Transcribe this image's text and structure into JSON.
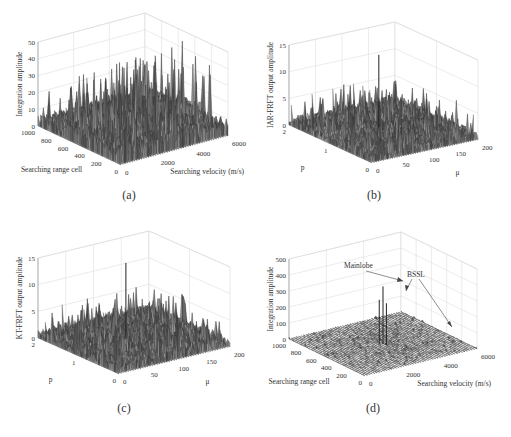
{
  "chart_data": [
    {
      "id": "a",
      "type": "surface3d",
      "caption": "(a)",
      "zlabel": "Integration amplitude",
      "xlabel": "Searching range cell",
      "ylabel": "Searching velocity (m/s)",
      "zticks": [
        "0",
        "10",
        "20",
        "30",
        "40",
        "50"
      ],
      "xticks": [
        "1000",
        "800",
        "600",
        "400",
        "200",
        "0"
      ],
      "yticks": [
        "0",
        "2000",
        "4000",
        "6000"
      ],
      "zlim": [
        0,
        50
      ],
      "xlim": [
        0,
        1000
      ],
      "ylim": [
        0,
        6000
      ],
      "noise_level": 0.35,
      "spike_level": 0.6,
      "peaks": []
    },
    {
      "id": "b",
      "type": "surface3d",
      "caption": "(b)",
      "zlabel": "IAR-FRFT output amplitude",
      "xlabel": "p",
      "ylabel": "μ",
      "zticks": [
        "0",
        "5",
        "10",
        "15"
      ],
      "xticks": [
        "2",
        "1",
        "0"
      ],
      "yticks": [
        "0",
        "50",
        "100",
        "150",
        "200"
      ],
      "zlim": [
        0,
        15
      ],
      "xlim": [
        0,
        2.5
      ],
      "ylim": [
        0,
        200
      ],
      "noise_level": 0.18,
      "spike_level": 0.3,
      "peaks": [
        {
          "u": 0.62,
          "v": 0.55,
          "h": 0.9
        }
      ]
    },
    {
      "id": "c",
      "type": "surface3d",
      "caption": "(c)",
      "zlabel": "KT-FRFT output amplitude",
      "xlabel": "p",
      "ylabel": "μ",
      "zticks": [
        "0",
        "5",
        "10",
        "15"
      ],
      "xticks": [
        "2",
        "1",
        "0"
      ],
      "yticks": [
        "0",
        "50",
        "100",
        "150",
        "200"
      ],
      "zlim": [
        0,
        15
      ],
      "xlim": [
        0,
        2.5
      ],
      "ylim": [
        0,
        200
      ],
      "noise_level": 0.2,
      "spike_level": 0.32,
      "peaks": [
        {
          "u": 0.6,
          "v": 0.5,
          "h": 0.95
        }
      ]
    },
    {
      "id": "d",
      "type": "surface3d",
      "caption": "(d)",
      "zlabel": "Integration amplitude",
      "xlabel": "Searching range cell",
      "ylabel": "Searching velocity (m/s)",
      "zticks": [
        "0",
        "100",
        "200",
        "300",
        "400",
        "500"
      ],
      "xticks": [
        "1000",
        "800",
        "600",
        "400",
        "200",
        "0"
      ],
      "yticks": [
        "0",
        "2000",
        "4000",
        "6000"
      ],
      "zlim": [
        0,
        500
      ],
      "xlim": [
        0,
        1000
      ],
      "ylim": [
        0,
        6000
      ],
      "noise_level": 0.02,
      "spike_level": 0.03,
      "peaks": [
        {
          "u": 0.5,
          "v": 0.5,
          "h": 0.72
        },
        {
          "u": 0.52,
          "v": 0.48,
          "h": 0.55
        },
        {
          "u": 0.47,
          "v": 0.51,
          "h": 0.52
        }
      ],
      "annotations": [
        {
          "text": "Mainlobe",
          "target": "mainlobe"
        },
        {
          "text": "BSSL",
          "target": "bssl"
        }
      ]
    }
  ]
}
